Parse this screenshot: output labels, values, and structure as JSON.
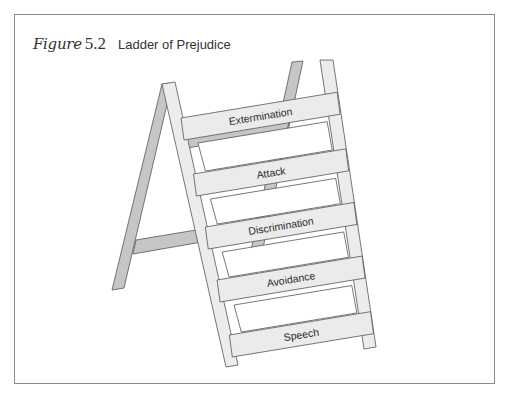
{
  "figure": {
    "label": "Figure",
    "number": "5.2",
    "caption": "Ladder of Prejudice"
  },
  "ladder": {
    "rungs": [
      {
        "label": "Extermination"
      },
      {
        "label": "Attack"
      },
      {
        "label": "Discrimination"
      },
      {
        "label": "Avoidance"
      },
      {
        "label": "Speech"
      }
    ]
  },
  "colors": {
    "front_ladder": "#ebebeb",
    "back_ladder": "#c4c4c4",
    "outline": "#555555",
    "frame": "#8a8a8a"
  }
}
